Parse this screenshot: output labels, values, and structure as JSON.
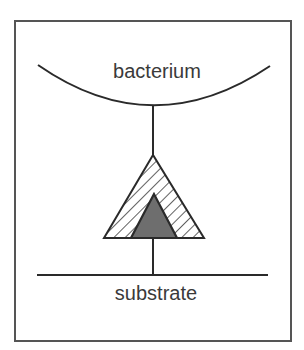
{
  "diagram": {
    "top_label": "bacterium",
    "bottom_label": "substrate",
    "icons": {
      "outer_triangle": "hatched-triangle",
      "inner_triangle": "filled-triangle"
    },
    "colors": {
      "stroke": "#2a2a2a",
      "frame": "#555555",
      "inner_fill": "#6e6e6e",
      "hatch": "#3a3a3a",
      "background": "#ffffff"
    }
  }
}
